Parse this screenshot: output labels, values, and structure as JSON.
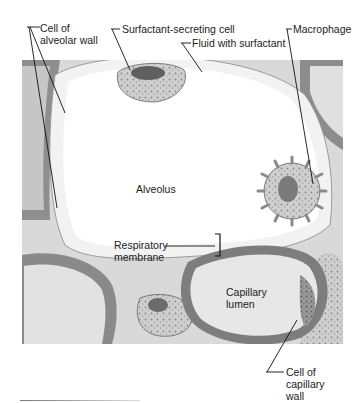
{
  "figure": {
    "labels": {
      "cell_of_alveolar_wall": [
        "Cell of",
        "alveolar wall"
      ],
      "surfactant_secreting_cell": "Surfactant-secreting cell",
      "fluid_with_surfactant": "Fluid with surfactant",
      "macrophage": "Macrophage",
      "alveolus": "Alveolus",
      "respiratory_membrane": [
        "Respiratory",
        "membrane"
      ],
      "capillary_lumen": [
        "Capillary",
        "lumen"
      ],
      "cell_of_capillary_wall": [
        "Cell of",
        "capillary",
        "wall"
      ]
    },
    "colors": {
      "background": "#ffffff",
      "tissue_light": "#ebebeb",
      "tissue_mid": "#b8b8b8",
      "tissue_dark": "#6f6f6f",
      "leader_line": "#111111"
    }
  }
}
